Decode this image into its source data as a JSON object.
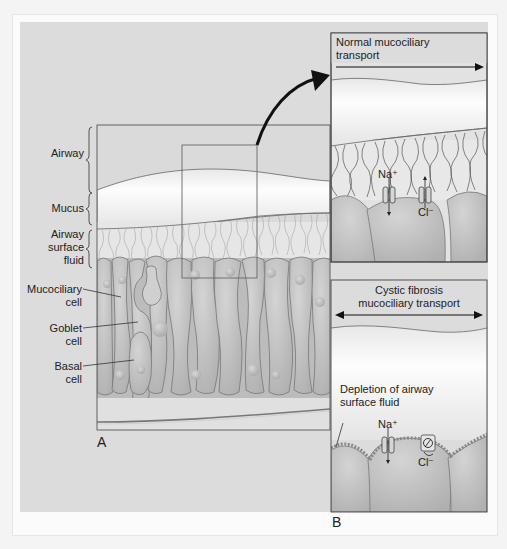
{
  "figure": {
    "panel_a": {
      "letter": "A",
      "labels": {
        "airway": "Airway",
        "mucus": "Mucus",
        "asf_line1": "Airway",
        "asf_line2": "surface",
        "asf_line3": "fluid",
        "mucociliary_line1": "Mucociliary",
        "mucociliary_line2": "cell",
        "goblet_line1": "Goblet",
        "goblet_line2": "cell",
        "basal_line1": "Basal",
        "basal_line2": "cell"
      }
    },
    "panel_normal": {
      "title_line1": "Normal mucociliary",
      "title_line2": "transport",
      "na": "Na⁺",
      "cl": "Cl⁻"
    },
    "panel_b": {
      "letter": "B",
      "title_line1": "Cystic fibrosis",
      "title_line2": "mucociliary transport",
      "depletion_line1": "Depletion of airway",
      "depletion_line2": "surface fluid",
      "na": "Na⁺",
      "cl": "Cl⁻"
    },
    "colors": {
      "background": "#dcdcdc",
      "mucus": "#f2f2f2",
      "cell": "#bdbdbd",
      "outline": "#555555"
    }
  }
}
